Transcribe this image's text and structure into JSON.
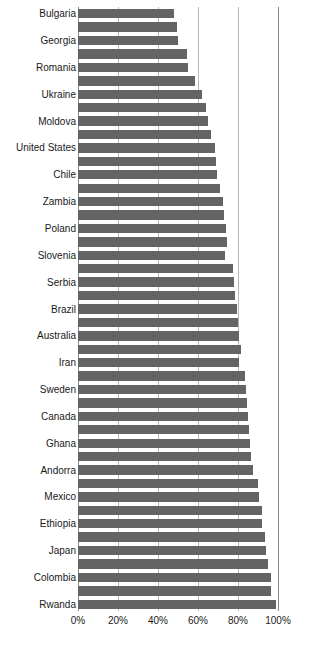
{
  "chart_data": {
    "type": "bar",
    "orientation": "horizontal",
    "title": "",
    "subtitle": "",
    "xlabel": "",
    "ylabel": "",
    "xlim": [
      0,
      100
    ],
    "xunit": "%",
    "grid": true,
    "legend": null,
    "legend_position": "none",
    "bar_color": "#646464",
    "gridline_color": "#b8b8b8",
    "axis_color": "#8a8a8a",
    "background": "#ffffff",
    "xticks": [
      0,
      20,
      40,
      60,
      80,
      100
    ],
    "xtick_labels": [
      "0%",
      "20%",
      "40%",
      "60%",
      "80%",
      "100%"
    ],
    "note": "Category labels are drawn on every other bar (odd-indexed bars are unlabeled).",
    "categories": [
      "Bulgaria",
      "",
      "Georgia",
      "",
      "Romania",
      "",
      "Ukraine",
      "",
      "Moldova",
      "",
      "United States",
      "",
      "Chile",
      "",
      "Zambia",
      "",
      "Poland",
      "",
      "Slovenia",
      "",
      "Serbia",
      "",
      "Brazil",
      "",
      "Australia",
      "",
      "Iran",
      "",
      "Sweden",
      "",
      "Canada",
      "",
      "Ghana",
      "",
      "Andorra",
      "",
      "Mexico",
      "",
      "Ethiopia",
      "",
      "Japan",
      "",
      "Colombia",
      "",
      "Rwanda"
    ],
    "values": [
      48.0,
      49.5,
      50.0,
      54.5,
      55.0,
      58.5,
      62.0,
      64.0,
      65.0,
      66.5,
      68.5,
      69.0,
      69.5,
      71.0,
      72.5,
      73.0,
      74.0,
      74.5,
      73.5,
      77.5,
      78.0,
      78.5,
      79.5,
      80.0,
      80.5,
      81.5,
      80.5,
      83.5,
      84.0,
      84.5,
      85.0,
      85.5,
      86.0,
      86.5,
      87.5,
      90.0,
      90.5,
      92.0,
      92.0,
      93.5,
      94.0,
      95.0,
      96.5,
      96.5,
      99.0
    ],
    "labeled_categories": [
      "Bulgaria",
      "Georgia",
      "Romania",
      "Ukraine",
      "Moldova",
      "United States",
      "Chile",
      "Zambia",
      "Poland",
      "Slovenia",
      "Serbia",
      "Brazil",
      "Australia",
      "Iran",
      "Sweden",
      "Canada",
      "Ghana",
      "Andorra",
      "Mexico",
      "Ethiopia",
      "Japan",
      "Colombia",
      "Rwanda"
    ]
  }
}
